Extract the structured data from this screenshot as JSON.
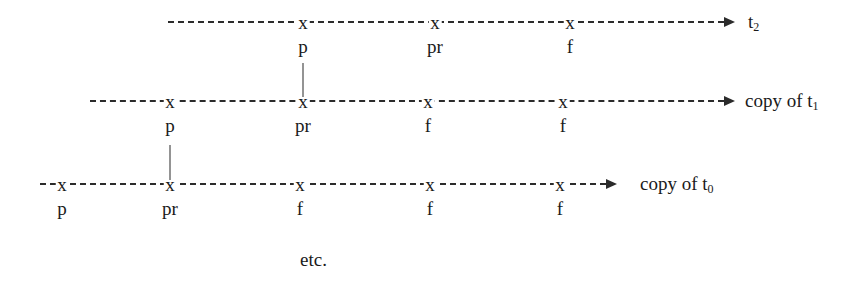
{
  "diagram": {
    "type": "timeline-sequence",
    "background_color": "#ffffff",
    "line_color": "#2b2b2b",
    "text_color": "#1a1a1a",
    "footnote": "etc.",
    "rows": [
      {
        "id": "row-t2",
        "caption_text": "t",
        "caption_sub": "2",
        "line_start_x": 168,
        "line_end_x": 724,
        "line_y": 21,
        "caption_x": 748,
        "label_y": 37,
        "ticks": [
          {
            "marker": "x",
            "label": "p",
            "x": 303
          },
          {
            "marker": "x",
            "label": "pr",
            "x": 435
          },
          {
            "marker": "x",
            "label": "f",
            "x": 570
          }
        ]
      },
      {
        "id": "row-copy-t1",
        "caption_text": "copy of t",
        "caption_sub": "1",
        "line_start_x": 90,
        "line_end_x": 724,
        "line_y": 100,
        "caption_x": 745,
        "label_y": 116,
        "ticks": [
          {
            "marker": "x",
            "label": "p",
            "x": 170
          },
          {
            "marker": "x",
            "label": "pr",
            "x": 303
          },
          {
            "marker": "x",
            "label": "f",
            "x": 428
          },
          {
            "marker": "x",
            "label": "f",
            "x": 563
          }
        ]
      },
      {
        "id": "row-copy-t0",
        "caption_text": "copy of t",
        "caption_sub": "0",
        "line_start_x": 40,
        "line_end_x": 606,
        "line_y": 183,
        "caption_x": 640,
        "label_y": 199,
        "ticks": [
          {
            "marker": "x",
            "label": "p",
            "x": 62
          },
          {
            "marker": "x",
            "label": "pr",
            "x": 170
          },
          {
            "marker": "x",
            "label": "f",
            "x": 300
          },
          {
            "marker": "x",
            "label": "f",
            "x": 430
          },
          {
            "marker": "x",
            "label": "f",
            "x": 560
          }
        ]
      }
    ],
    "connectors": [
      {
        "id": "connector-t2-p-to-t1",
        "x": 303,
        "y_top": 63,
        "y_bottom": 97
      },
      {
        "id": "connector-t1-p-to-t0",
        "x": 170,
        "y_top": 145,
        "y_bottom": 180
      }
    ],
    "footnote_x": 300,
    "footnote_y": 250
  }
}
